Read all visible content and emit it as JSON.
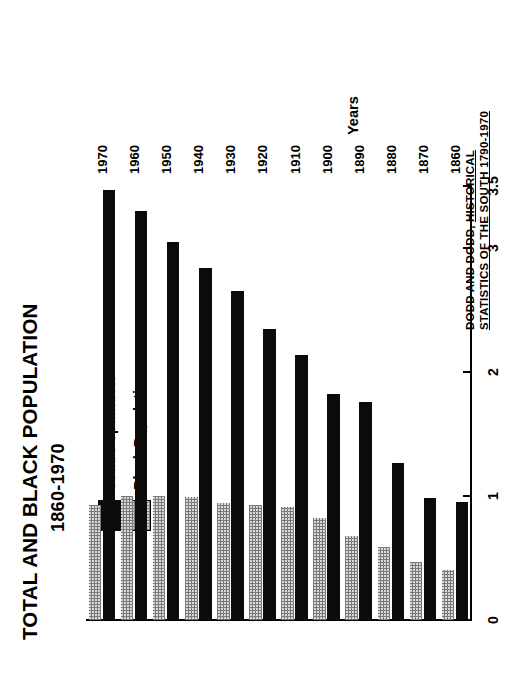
{
  "chart_data": {
    "type": "bar",
    "orientation": "vertical",
    "title": "TOTAL AND BLACK POPULATION",
    "subtitle": "1860-1970",
    "xlabel": "Years",
    "ylabel": "Total Population (Milllions)",
    "ylim": [
      0,
      3.5
    ],
    "yticks": [
      "0",
      "1",
      "2",
      "3",
      "3.5"
    ],
    "ytick_values": [
      0,
      1,
      2,
      3,
      3.5
    ],
    "grid": false,
    "legend_position": "upper-left-inside",
    "categories": [
      "1860",
      "1870",
      "1880",
      "1890",
      "1900",
      "1910",
      "1920",
      "1930",
      "1940",
      "1950",
      "1960",
      "1970"
    ],
    "series": [
      {
        "name": "Total Population",
        "style": "solid-black",
        "color": "#0b0b0b",
        "values": [
          0.95,
          0.98,
          1.27,
          1.76,
          1.82,
          2.14,
          2.35,
          2.65,
          2.84,
          3.05,
          3.3,
          3.47
        ]
      },
      {
        "name": "Black Population",
        "style": "stippled",
        "color": "#d9d9d9",
        "values": [
          0.4,
          0.47,
          0.59,
          0.68,
          0.82,
          0.91,
          0.93,
          0.94,
          0.99,
          1.0,
          1.0,
          0.93
        ]
      }
    ],
    "source": {
      "prefix": "DODD AND DODD, ",
      "line1_underlined": "HISTORICAL",
      "line2_underlined": "STATISTICS OF THE SOUTH 1790-1970"
    }
  },
  "legend": {
    "items": [
      {
        "label": "Total Population",
        "swatch": "solid-black-swatch"
      },
      {
        "label": "Black Population",
        "swatch": "stippled-swatch"
      }
    ]
  }
}
